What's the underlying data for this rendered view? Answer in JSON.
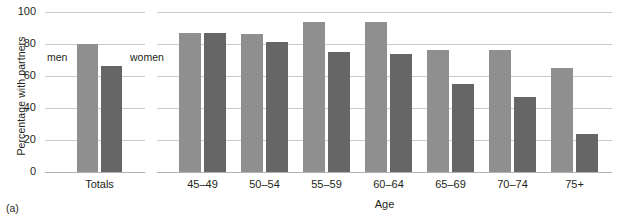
{
  "figure": {
    "index_label": "(a)",
    "top_cut_text": ""
  },
  "chart_data": {
    "type": "bar",
    "title": "",
    "xlabel": "Age",
    "ylabel": "Percentage with partners",
    "ylim": [
      0,
      100
    ],
    "yticks": [
      0,
      20,
      40,
      60,
      80,
      100
    ],
    "grid": true,
    "legend_position": "inline-at-totals",
    "categories": [
      "Totals",
      "45–49",
      "50–54",
      "55–59",
      "60–64",
      "65–69",
      "70–74",
      "75+"
    ],
    "series": [
      {
        "name": "men",
        "color": "#8f8f8f",
        "values": [
          80,
          87,
          86,
          94,
          94,
          76,
          76,
          65
        ]
      },
      {
        "name": "women",
        "color": "#666666",
        "values": [
          66,
          87,
          81,
          75,
          74,
          55,
          47,
          24
        ]
      }
    ],
    "panels": [
      {
        "name": "Totals",
        "categories": [
          "Totals"
        ]
      },
      {
        "name": "Age",
        "categories": [
          "45–49",
          "50–54",
          "55–59",
          "60–64",
          "65–69",
          "70–74",
          "75+"
        ]
      }
    ]
  }
}
